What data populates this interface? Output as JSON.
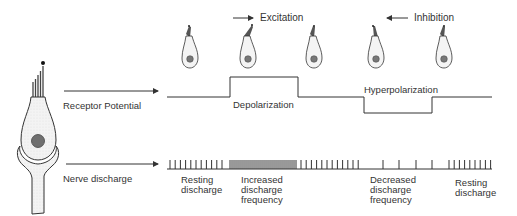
{
  "diagram": {
    "colors": {
      "line": "#333333",
      "cell_fill": "#f1f1f1",
      "nucleus": "#7a7a7a",
      "stereocilia": "#555555"
    },
    "direction_labels": {
      "excitation": "Excitation",
      "inhibition": "Inhibition"
    },
    "row_labels": {
      "receptor_potential": "Receptor Potential",
      "nerve_discharge": "Nerve discharge"
    },
    "receptor_potential": {
      "depolarization": "Depolarization",
      "hyperpolarization": "Hyperpolarization"
    },
    "nerve_discharge": {
      "phases": [
        {
          "label": "Resting\ndischarge"
        },
        {
          "label": "Increased\ndischarge\nfrequency"
        },
        {
          "label": "Decreased\ndischarge\nfrequency"
        },
        {
          "label": "Resting\ndischarge"
        }
      ]
    },
    "small_cells": [
      {
        "state": "resting",
        "bundle_tilt": "upright"
      },
      {
        "state": "excitation",
        "bundle_tilt": "toward-kinocilium"
      },
      {
        "state": "resting",
        "bundle_tilt": "upright"
      },
      {
        "state": "inhibition",
        "bundle_tilt": "away-from-kinocilium"
      },
      {
        "state": "resting",
        "bundle_tilt": "upright"
      }
    ]
  }
}
